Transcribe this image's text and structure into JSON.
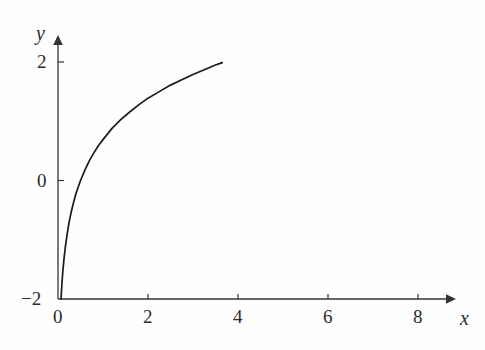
{
  "chart_data": {
    "type": "line",
    "title": "",
    "subtitle": "",
    "xlabel": "x",
    "ylabel": "y",
    "function": "y = ln(x)",
    "xlim": [
      0,
      8.6
    ],
    "ylim": [
      -2,
      2.35
    ],
    "xticks": [
      0,
      2,
      4,
      6,
      8
    ],
    "xtick_labels": [
      "0",
      "2",
      "4",
      "6",
      "8"
    ],
    "yticks": [
      -2,
      0,
      2
    ],
    "ytick_labels": [
      "−2",
      "0",
      "2"
    ],
    "grid": false,
    "legend": null,
    "series": [
      {
        "name": "y = ln(x)",
        "color": "#1a1a1a",
        "x": [
          0.135,
          0.15,
          0.18,
          0.22,
          0.27,
          0.33,
          0.4,
          0.5,
          0.6,
          0.7,
          0.8,
          0.9,
          1.0,
          1.2,
          1.4,
          1.6,
          1.8,
          2.0,
          2.4,
          2.8,
          3.2,
          3.6,
          4.0,
          4.5,
          5.0,
          5.5,
          6.0,
          6.5,
          7.0,
          7.3
        ],
        "y": [
          -2.0,
          -1.9,
          -1.71,
          -1.51,
          -1.31,
          -1.11,
          -0.92,
          -0.69,
          -0.51,
          -0.36,
          -0.22,
          -0.11,
          0.0,
          0.18,
          0.34,
          0.47,
          0.59,
          0.69,
          0.88,
          1.03,
          1.16,
          1.28,
          1.39,
          1.5,
          1.61,
          1.7,
          1.79,
          1.87,
          1.95,
          1.99
        ]
      }
    ],
    "annotations": [],
    "axis_style": {
      "arrow_heads": true,
      "axis_color": "#333333",
      "background": "#fefefe"
    }
  },
  "labels": {
    "x_axis_name": "x",
    "y_axis_name": "y",
    "x_tick_0": "0",
    "x_tick_2": "2",
    "x_tick_4": "4",
    "x_tick_6": "6",
    "x_tick_8": "8",
    "y_tick_neg2": "−2",
    "y_tick_0": "0",
    "y_tick_2": "2"
  }
}
